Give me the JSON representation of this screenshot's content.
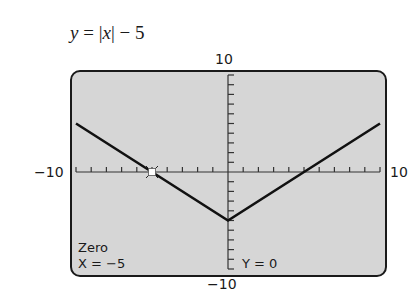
{
  "title": {
    "lhs": "y",
    "eq": " = |",
    "var": "x",
    "rhs": "| − 5"
  },
  "window": {
    "xmin_label": "−10",
    "xmax_label": "10",
    "ymin_label": "−10",
    "ymax_label": "10"
  },
  "readout": {
    "mode": "Zero",
    "x": "X = −5",
    "y": "Y = 0"
  },
  "colors": {
    "screen_bg": "#d6d6d6",
    "curve": "#111111",
    "cursor": "#ffffff"
  },
  "chart_data": {
    "type": "line",
    "title": "y = |x| − 5",
    "xlabel": "",
    "ylabel": "",
    "xlim": [
      -10,
      10
    ],
    "ylim": [
      -10,
      10
    ],
    "x_ticks_every": 1,
    "y_ticks_every": 1,
    "grid": false,
    "series": [
      {
        "name": "y = |x| − 5",
        "x": [
          -10,
          -5,
          0,
          5,
          10
        ],
        "y": [
          5,
          0,
          -5,
          0,
          5
        ]
      }
    ],
    "annotations": [
      {
        "type": "cursor",
        "x": -5,
        "y": 0,
        "label": "Zero"
      },
      {
        "text": "Zero",
        "position": "bottom-left"
      },
      {
        "text": "X = −5",
        "position": "bottom-left"
      },
      {
        "text": "Y = 0",
        "position": "bottom-center"
      }
    ]
  }
}
